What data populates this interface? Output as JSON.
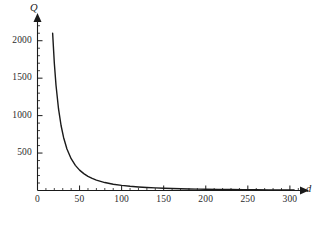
{
  "chart_data": {
    "type": "line",
    "title": "",
    "subtitle": "",
    "xlabel": "d",
    "ylabel": "Q",
    "xlim": [
      0,
      312
    ],
    "ylim": [
      0,
      2250
    ],
    "xticks": [
      0,
      50,
      100,
      150,
      200,
      250,
      300
    ],
    "yticks": [
      500,
      1000,
      1500,
      2000
    ],
    "xtick_labels": [
      "0",
      "50",
      "100",
      "150",
      "200",
      "250",
      "300"
    ],
    "ytick_labels": [
      "500",
      "1000",
      "1500",
      "2000"
    ],
    "minor_tick_step_x": 10,
    "minor_tick_step_y": 100,
    "grid": false,
    "legend": null,
    "legend_position": "none",
    "axis_arrows": true,
    "series": [
      {
        "name": "Q(d)",
        "color": "#1a1a1a",
        "linewidth": 1.4,
        "x": [
          18,
          20,
          22,
          25,
          28,
          31,
          35,
          40,
          45,
          50,
          55,
          60,
          65,
          70,
          80,
          90,
          100,
          110,
          120,
          130,
          140,
          150,
          160,
          170,
          180,
          190,
          200,
          215,
          230,
          245,
          260,
          275,
          290,
          305
        ],
        "y": [
          2100,
          1700,
          1405,
          1089,
          868,
          708,
          555,
          425,
          336,
          272,
          225,
          189,
          161,
          139,
          106,
          84,
          68,
          56,
          47,
          40,
          35,
          30,
          27,
          24,
          21,
          19,
          17,
          15,
          13,
          11,
          10,
          9,
          8,
          8
        ]
      }
    ],
    "annotations": []
  },
  "axis": {
    "x_name": "d",
    "y_name": "Q"
  }
}
